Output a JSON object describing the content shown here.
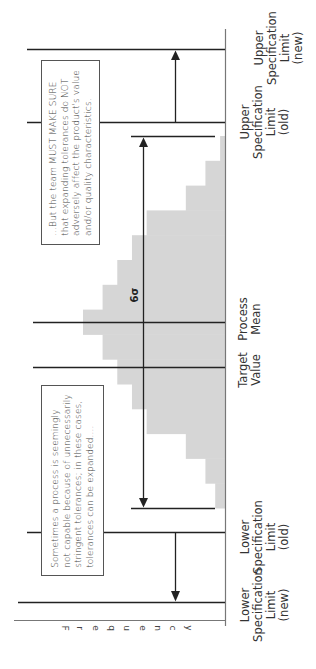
{
  "diagram": {
    "y_axis_label": "Frequency",
    "sigma_label": "6σ",
    "colors": {
      "histogram_fill": "#d6d6d6",
      "lines": "#222222",
      "axis": "#777777"
    },
    "reference_lines": [
      {
        "id": "usl-new",
        "label": [
          "Upper",
          "Specification",
          "Limit",
          "(new)"
        ]
      },
      {
        "id": "usl-old",
        "label": [
          "Upper",
          "Specification",
          "Limit",
          "(old)"
        ]
      },
      {
        "id": "process-mean",
        "label": [
          "Process",
          "Mean"
        ]
      },
      {
        "id": "target-value",
        "label": [
          "Target",
          "Value"
        ]
      },
      {
        "id": "lsl-old",
        "label": [
          "Lower",
          "Specification",
          "Limit",
          "(old)"
        ]
      },
      {
        "id": "lsl-new",
        "label": [
          "Lower",
          "Specification",
          "Limit",
          "(new)"
        ]
      }
    ],
    "callouts": {
      "lower": [
        "Sometimes a process is seemingly",
        "not capable because of unnecessarily",
        "stringent tolerances; in these cases,",
        "tolerances can be expanded...."
      ],
      "upper": [
        "...But the team MUST MAKE SURE",
        "that expanding tolerances do NOT",
        "adversely affect the product's value",
        "and/or quality characteristics."
      ]
    }
  },
  "chart_data": {
    "type": "bar",
    "orientation": "rotated 90° clockwise (value axis vertical, frequency axis horizontal)",
    "title": "",
    "xlabel": "",
    "ylabel": "Frequency",
    "bins_low_to_high": [
      {
        "bin": 1,
        "frequency": 1
      },
      {
        "bin": 2,
        "frequency": 2
      },
      {
        "bin": 3,
        "frequency": 4
      },
      {
        "bin": 4,
        "frequency": 8
      },
      {
        "bin": 5,
        "frequency": 9.5
      },
      {
        "bin": 6,
        "frequency": 11
      },
      {
        "bin": 7,
        "frequency": 12.5
      },
      {
        "bin": 8,
        "frequency": 14.5
      },
      {
        "bin": 9,
        "frequency": 12.5
      },
      {
        "bin": 10,
        "frequency": 11
      },
      {
        "bin": 11,
        "frequency": 9.5
      },
      {
        "bin": 12,
        "frequency": 8
      },
      {
        "bin": 13,
        "frequency": 4
      },
      {
        "bin": 14,
        "frequency": 2
      },
      {
        "bin": 15,
        "frequency": 0.5
      }
    ],
    "annotations": [
      "6σ spread of process",
      "USL moved outward (old → new)",
      "LSL moved outward (old → new)"
    ]
  }
}
